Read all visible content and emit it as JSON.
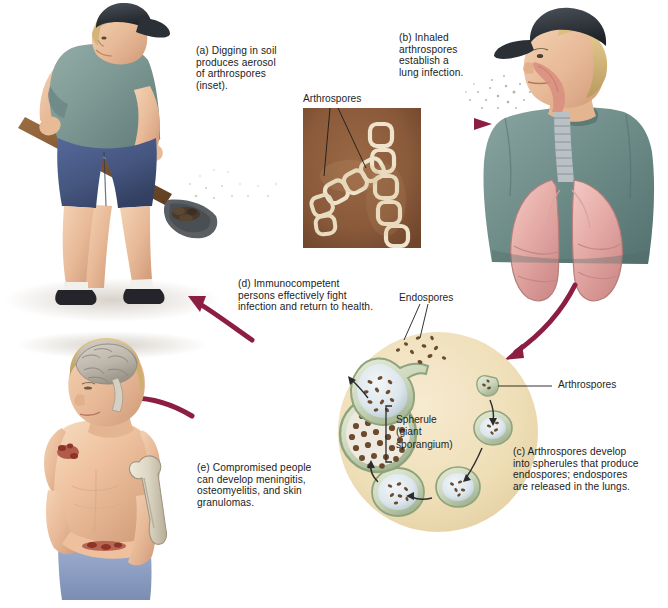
{
  "figure": {
    "accent_arrow_color": "#8c1e42",
    "inset_bg_color": "#8a5a3b",
    "spherule_circle_color": "#f0dfb8"
  },
  "captions": {
    "a": "(a) Digging in soil\nproduces aerosol\nof arthrospores\n(inset).",
    "b": "(b) Inhaled\narthrospores\nestablish a\nlung infection.",
    "c": "(c) Arthrospores develop\ninto spherules that produce\nendospores; endospores\nare released in the lungs.",
    "d": "(d) Immunocompetent\npersons effectively fight\ninfection and return to health.",
    "e": "(e) Compromised people\ncan develop meningitis,\nosteomyelitis, and skin\ngranulomas."
  },
  "labels": {
    "inset_arthrospores": "Arthrospores",
    "endospores": "Endospores",
    "arthrospores_cycle": "Arthrospores",
    "spherule": "Spherule\n(giant\nsporangium)"
  },
  "scenes": {
    "digger": {
      "name": "man-digging-soil",
      "cap_color": "#2e3338",
      "shirt_color": "#7f9a96",
      "shorts_color": "#44557e",
      "tool": "shovel",
      "shoe_color": "#1f1f22"
    },
    "inhaler": {
      "name": "man-inhaling-arthrospores",
      "cap_color": "#343a40",
      "shirt_color": "#6d8b87",
      "lung_color": "#e8b2ae",
      "trachea_color": "#b9c1c4"
    },
    "compromised": {
      "name": "compromised-patient",
      "brain_color": "#c9c3bb",
      "bone_color": "#ddd6c4",
      "skin_color": "#e6b68f",
      "lesion_color": "#a4483a",
      "jeans_color": "#8d9ec4"
    },
    "micrograph": {
      "name": "arthrospore-micrograph-inset",
      "background": "#8a5a3b",
      "spore_color": "#efe4cb"
    }
  }
}
